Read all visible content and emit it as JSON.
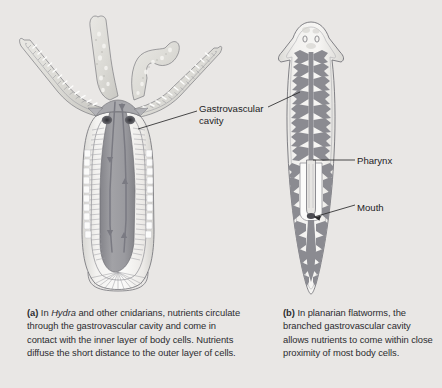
{
  "figure": {
    "background_color": "#e9e7e5",
    "panels": [
      {
        "id": "panel-a",
        "organism": "Hydra",
        "letter": "(a)",
        "caption_lead": "(a)",
        "caption_text": " In Hydra and other cnidarians, nutrients circulate through the gastrovascular cavity and come in contact with the inner layer of body cells. Nutrients diffuse the short distance to the outer layer of cells.",
        "caption_italic_word": "Hydra",
        "caption_part_1": " In ",
        "caption_part_2": " and other cnidarians, nutrients circulate through the gastrovascular cavity and come in contact with the inner layer of body cells. Nutrients diffuse the short distance to the outer layer of cells."
      },
      {
        "id": "panel-b",
        "organism": "planarian flatworm",
        "letter": "(b)",
        "caption_lead": "(b)",
        "caption_text": " In planarian flatworms, the branched gastrovascular cavity allows nutrients to come within close proximity of most body cells."
      }
    ],
    "labels": [
      {
        "id": "gastrovascular-cavity",
        "text": "Gastrovascular\ncavity",
        "line1": "Gastrovascular",
        "line2": "cavity",
        "points_to": [
          "hydra-cavity",
          "planarian-cavity"
        ]
      },
      {
        "id": "pharynx",
        "text": "Pharynx",
        "points_to": [
          "planarian-pharynx"
        ]
      },
      {
        "id": "mouth",
        "text": "Mouth",
        "points_to": [
          "planarian-mouth"
        ]
      }
    ],
    "colors": {
      "background": "#e9e7e5",
      "cavity_fill": "#9a9a9e",
      "body_pale": "#efeeec",
      "outline": "#6f6f74",
      "tissue_mid": "#8d8d92",
      "tentacle_fill": "#e2e1de",
      "arrow": "#7d7d84",
      "text": "#1d1d1f",
      "leader_line": "#2a2a2c",
      "mouth_dark": "#4a4a4f"
    },
    "anatomy": {
      "hydra": {
        "tentacle_count": 5,
        "features": [
          "tentacles",
          "mouth",
          "gastrovascular cavity",
          "inner cell layer",
          "outer cell layer",
          "basal disc",
          "circulation arrows"
        ]
      },
      "planarian": {
        "features": [
          "eyespots",
          "branched gastrovascular cavity",
          "pharynx",
          "mouth",
          "auricles",
          "tapered tail"
        ]
      }
    }
  }
}
